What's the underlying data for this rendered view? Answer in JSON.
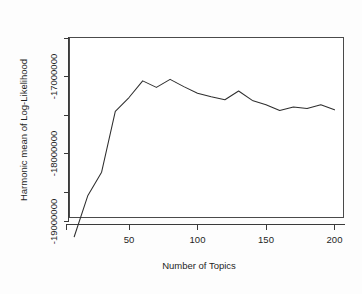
{
  "chart_data": {
    "type": "line",
    "title": "",
    "xlabel": "Number of Topics",
    "ylabel": "Harmonic mean of Log-Likelihood",
    "xlim": [
      8,
      205
    ],
    "ylim": [
      -19250000,
      -16880000
    ],
    "grid": false,
    "legend": "none",
    "x_ticks": [
      50,
      100,
      150,
      200
    ],
    "x_tick_labels": [
      "50",
      "100",
      "150",
      "200"
    ],
    "y_ticks": [
      -17000000,
      -18000000,
      -19000000
    ],
    "y_tick_labels": [
      "-17000000",
      "-18000000",
      "-19000000"
    ],
    "y_minor_ticks": [
      -17500000,
      -18500000
    ],
    "x": [
      10,
      20,
      30,
      40,
      50,
      60,
      70,
      80,
      90,
      100,
      110,
      120,
      130,
      140,
      150,
      160,
      170,
      180,
      190,
      200
    ],
    "values": [
      -19210000,
      -18640000,
      -18320000,
      -17480000,
      -17290000,
      -17060000,
      -17150000,
      -17040000,
      -17140000,
      -17230000,
      -17280000,
      -17320000,
      -17200000,
      -17330000,
      -17390000,
      -17470000,
      -17420000,
      -17440000,
      -17390000,
      -17460000
    ],
    "series": [
      {
        "name": "Harmonic mean of Log-Likelihood",
        "color": "#2e2e2e",
        "values": [
          -19210000,
          -18640000,
          -18320000,
          -17480000,
          -17290000,
          -17060000,
          -17150000,
          -17040000,
          -17140000,
          -17230000,
          -17280000,
          -17320000,
          -17200000,
          -17330000,
          -17390000,
          -17470000,
          -17420000,
          -17440000,
          -17390000,
          -17460000
        ]
      }
    ]
  },
  "axes": {
    "x_title": "Number of Topics",
    "y_title": "Harmonic mean of Log-Likelihood"
  }
}
